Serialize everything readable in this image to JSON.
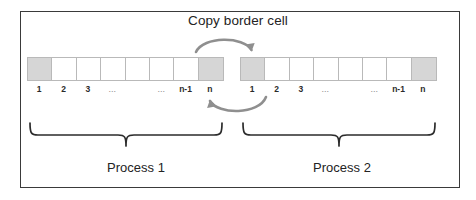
{
  "figure": {
    "title": "Copy border cell",
    "frame_color": "#3a3a3a",
    "background": "#ffffff"
  },
  "cells": {
    "shaded_color": "#d6d6d6",
    "empty_color": "#ffffff",
    "border_color": "#b9b9b9",
    "count_per_row": 8
  },
  "rows": [
    {
      "name": "process-1-row",
      "labels": [
        "1",
        "2",
        "3",
        "...",
        "",
        "...",
        "n-1",
        "n"
      ],
      "shaded": [
        true,
        false,
        false,
        false,
        false,
        false,
        false,
        true
      ]
    },
    {
      "name": "process-2-row",
      "labels": [
        "1",
        "2",
        "3",
        "...",
        "",
        "...",
        "n-1",
        "n"
      ],
      "shaded": [
        true,
        false,
        false,
        false,
        false,
        false,
        false,
        true
      ]
    }
  ],
  "arrows": [
    {
      "name": "copy-arrow-top",
      "direction": "left-to-right",
      "from": "process-1-cell-n",
      "to": "process-2-cell-1",
      "color": "#8f8f8f"
    },
    {
      "name": "copy-arrow-bottom",
      "direction": "right-to-left",
      "from": "process-2-cell-2",
      "to": "process-1-cell-n-1",
      "color": "#8f8f8f"
    }
  ],
  "braces": [
    {
      "name": "process-1-brace",
      "color": "#2b2b2b"
    },
    {
      "name": "process-2-brace",
      "color": "#2b2b2b"
    }
  ],
  "captions": {
    "process_1": "Process 1",
    "process_2": "Process 2"
  }
}
